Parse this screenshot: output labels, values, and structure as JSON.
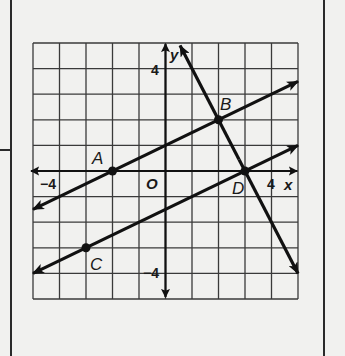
{
  "chart_data": {
    "type": "line",
    "title": "",
    "xlabel": "x",
    "ylabel": "y",
    "xlim": [
      -5,
      5
    ],
    "ylim": [
      -5,
      5
    ],
    "grid": true,
    "grid_step": 1,
    "tick_labels": {
      "x": [
        {
          "value": -4,
          "label": "−4"
        },
        {
          "value": 4,
          "label": "4"
        }
      ],
      "y": [
        {
          "value": 4,
          "label": "4"
        },
        {
          "value": -4,
          "label": "−4"
        }
      ],
      "origin": "O"
    },
    "points": [
      {
        "name": "A",
        "x": -2,
        "y": 0
      },
      {
        "name": "B",
        "x": 2,
        "y": 2
      },
      {
        "name": "C",
        "x": -3,
        "y": -3
      },
      {
        "name": "D",
        "x": 3,
        "y": 0
      }
    ],
    "series": [
      {
        "name": "line AB",
        "equation": "y = 0.5x + 1",
        "slope": 0.5,
        "intercept": 1,
        "from": [
          -5,
          -1.5
        ],
        "to": [
          5,
          3.5
        ]
      },
      {
        "name": "line CD",
        "equation": "y = 0.5x - 1.5",
        "slope": 0.5,
        "intercept": -1.5,
        "from": [
          -5,
          -4
        ],
        "to": [
          5,
          1
        ]
      },
      {
        "name": "line BD",
        "equation": "y = -2x + 6",
        "slope": -2,
        "intercept": 6,
        "from": [
          0.55,
          4.9
        ],
        "to": [
          5,
          -4
        ]
      }
    ],
    "legend": "none"
  },
  "labels": {
    "x_axis": "x",
    "y_axis": "y",
    "origin": "O",
    "x_neg": "−4",
    "x_pos": "4",
    "y_pos": "4",
    "y_neg": "−4",
    "point_A": "A",
    "point_B": "B",
    "point_C": "C",
    "point_D": "D"
  },
  "colors": {
    "background": "#f1f1ef",
    "grid": "#3a3a3a",
    "ink": "#111111"
  }
}
